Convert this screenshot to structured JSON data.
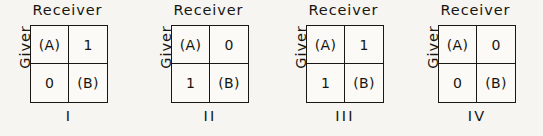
{
  "figure": {
    "background_color": "#f6f5f2",
    "ink_color": "#1a1814",
    "matrices": [
      {
        "panel_label": "I",
        "column_header": "Receiver",
        "row_header": "Giver",
        "cells": [
          "(A)",
          "1",
          "0",
          "(B)"
        ],
        "left": 0
      },
      {
        "panel_label": "II",
        "column_header": "Receiver",
        "row_header": "Giver",
        "cells": [
          "(A)",
          "0",
          "1",
          "(B)"
        ],
        "left": 141
      },
      {
        "panel_label": "III",
        "column_header": "Receiver",
        "row_header": "Giver",
        "cells": [
          "(A)",
          "1",
          "1",
          "(B)"
        ],
        "left": 276
      },
      {
        "panel_label": "IV",
        "column_header": "Receiver",
        "row_header": "Giver",
        "cells": [
          "(A)",
          "0",
          "0",
          "(B)"
        ],
        "left": 408
      }
    ]
  }
}
